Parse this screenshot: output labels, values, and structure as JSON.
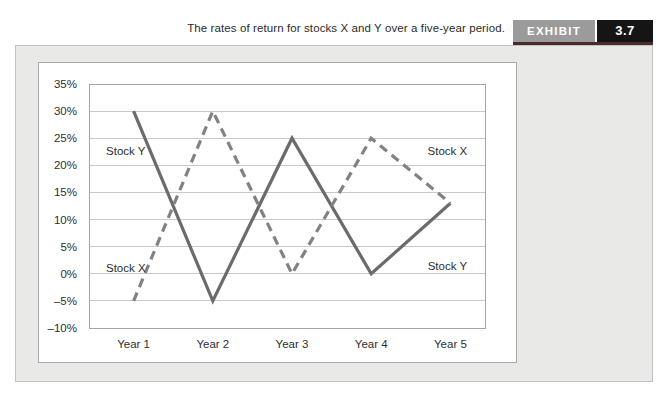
{
  "header": {
    "caption": "The rates of return for stocks X and Y over a five-year period.",
    "exhibit_label": "EXHIBIT",
    "exhibit_number": "3.7"
  },
  "colors": {
    "panel_background": "#e9e9e8",
    "panel_border": "#c2c2c2",
    "chart_box_border": "#a9a9a9",
    "plot_border": "#a5a5a5",
    "gridline": "#c9c9c9",
    "exhibit_badge_background": "#9b9b9b",
    "exhibit_number_background": "#151515",
    "badge_underline": "#4a2b25",
    "stock_y_line": "#6b6b6b",
    "stock_x_line": "#828282",
    "text": "#2e2e2e"
  },
  "chart_data": {
    "type": "line",
    "title": "The rates of return for stocks X and Y over a five-year period.",
    "xlabel": "",
    "ylabel": "",
    "categories": [
      "Year 1",
      "Year 2",
      "Year 3",
      "Year 4",
      "Year 5"
    ],
    "series": [
      {
        "name": "Stock Y",
        "style": "solid",
        "color": "#6b6b6b",
        "values": [
          30,
          -5,
          25,
          0,
          13
        ]
      },
      {
        "name": "Stock X",
        "style": "dashed",
        "color": "#828282",
        "values": [
          -5,
          30,
          0,
          25,
          13
        ]
      }
    ],
    "ylim": [
      -10,
      35
    ],
    "ytick_step": 5,
    "ytick_labels": [
      "35%",
      "30%",
      "25%",
      "20%",
      "15%",
      "10%",
      "5%",
      "0%",
      "–5%",
      "–10%"
    ],
    "grid": true,
    "legend_position": "in-plot annotations",
    "annotations": [
      {
        "text": "Stock Y",
        "fx": 0.093,
        "fy": 0.275
      },
      {
        "text": "Stock X",
        "fx": 0.093,
        "fy": 0.755
      },
      {
        "text": "Stock X",
        "fx": 0.905,
        "fy": 0.275
      },
      {
        "text": "Stock Y",
        "fx": 0.905,
        "fy": 0.745
      }
    ]
  }
}
